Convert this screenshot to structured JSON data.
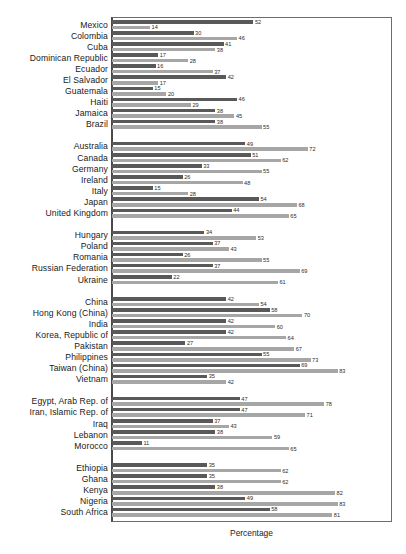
{
  "chart_data": {
    "type": "bar",
    "orientation": "horizontal",
    "title": "",
    "xlabel": "Percentage",
    "ylabel": "",
    "xlim": [
      0,
      100
    ],
    "grid": false,
    "legend": null,
    "series": [
      {
        "name": "series-1",
        "color": "#595959"
      },
      {
        "name": "series-2",
        "color": "#a6a6a6"
      }
    ],
    "groups": [
      {
        "name": "group-1",
        "rows": [
          {
            "category": "Mexico",
            "values": [
              52,
              14
            ]
          },
          {
            "category": "Colombia",
            "values": [
              30,
              46
            ]
          },
          {
            "category": "Cuba",
            "values": [
              41,
              38
            ]
          },
          {
            "category": "Dominican Republic",
            "values": [
              17,
              28
            ]
          },
          {
            "category": "Ecuador",
            "values": [
              16,
              37
            ]
          },
          {
            "category": "El Salvador",
            "values": [
              42,
              17
            ]
          },
          {
            "category": "Guatemala",
            "values": [
              15,
              20
            ]
          },
          {
            "category": "Haiti",
            "values": [
              46,
              29
            ]
          },
          {
            "category": "Jamaica",
            "values": [
              38,
              45
            ]
          },
          {
            "category": "Brazil",
            "values": [
              38,
              55
            ]
          }
        ]
      },
      {
        "name": "group-2",
        "rows": [
          {
            "category": "Australia",
            "values": [
              49,
              72
            ]
          },
          {
            "category": "Canada",
            "values": [
              51,
              62
            ]
          },
          {
            "category": "Germany",
            "values": [
              33,
              55
            ]
          },
          {
            "category": "Ireland",
            "values": [
              26,
              48
            ]
          },
          {
            "category": "Italy",
            "values": [
              15,
              28
            ]
          },
          {
            "category": "Japan",
            "values": [
              54,
              68
            ]
          },
          {
            "category": "United Kingdom",
            "values": [
              44,
              65
            ]
          }
        ]
      },
      {
        "name": "group-3",
        "rows": [
          {
            "category": "Hungary",
            "values": [
              34,
              53
            ]
          },
          {
            "category": "Poland",
            "values": [
              37,
              43
            ]
          },
          {
            "category": "Romania",
            "values": [
              26,
              55
            ]
          },
          {
            "category": "Russian Federation",
            "values": [
              37,
              69
            ]
          },
          {
            "category": "Ukraine",
            "values": [
              22,
              61
            ]
          }
        ]
      },
      {
        "name": "group-4",
        "rows": [
          {
            "category": "China",
            "values": [
              42,
              54
            ]
          },
          {
            "category": "Hong Kong (China)",
            "values": [
              58,
              70
            ]
          },
          {
            "category": "India",
            "values": [
              42,
              60
            ]
          },
          {
            "category": "Korea, Republic of",
            "values": [
              42,
              64
            ]
          },
          {
            "category": "Pakistan",
            "values": [
              27,
              67
            ]
          },
          {
            "category": "Philippines",
            "values": [
              55,
              73
            ]
          },
          {
            "category": "Taiwan (China)",
            "values": [
              69,
              83
            ]
          },
          {
            "category": "Vietnam",
            "values": [
              35,
              42
            ]
          }
        ]
      },
      {
        "name": "group-5",
        "rows": [
          {
            "category": "Egypt, Arab Rep. of",
            "values": [
              47,
              78
            ]
          },
          {
            "category": "Iran, Islamic Rep. of",
            "values": [
              47,
              71
            ]
          },
          {
            "category": "Iraq",
            "values": [
              37,
              43
            ]
          },
          {
            "category": "Lebanon",
            "values": [
              38,
              59
            ]
          },
          {
            "category": "Morocco",
            "values": [
              11,
              65
            ]
          }
        ]
      },
      {
        "name": "group-6",
        "rows": [
          {
            "category": "Ethiopia",
            "values": [
              35,
              62
            ]
          },
          {
            "category": "Ghana",
            "values": [
              35,
              62
            ]
          },
          {
            "category": "Kenya",
            "values": [
              38,
              82
            ]
          },
          {
            "category": "Nigeria",
            "values": [
              49,
              83
            ]
          },
          {
            "category": "South Africa",
            "values": [
              58,
              81
            ]
          }
        ]
      }
    ]
  }
}
